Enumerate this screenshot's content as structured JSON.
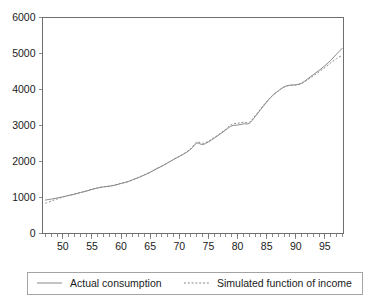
{
  "chart_data": {
    "type": "line",
    "title": "",
    "subtitle": "",
    "xlabel": "",
    "ylabel": "",
    "xlim": [
      1946.5,
      1998.2
    ],
    "ylim": [
      0,
      6000
    ],
    "grid": false,
    "legend_position": "bottom",
    "x_tick_labels": [
      "50",
      "55",
      "60",
      "65",
      "70",
      "75",
      "80",
      "85",
      "90",
      "95"
    ],
    "x_tick_values": [
      1950,
      1955,
      1960,
      1965,
      1970,
      1975,
      1980,
      1985,
      1990,
      1995
    ],
    "x_minor_tick_step": 1,
    "y_tick_labels": [
      "0",
      "1000",
      "2000",
      "3000",
      "4000",
      "5000",
      "6000"
    ],
    "y_tick_values": [
      0,
      1000,
      2000,
      3000,
      4000,
      5000,
      6000
    ],
    "x": [
      1947,
      1948,
      1949,
      1950,
      1951,
      1952,
      1953,
      1954,
      1955,
      1956,
      1957,
      1958,
      1959,
      1960,
      1961,
      1962,
      1963,
      1964,
      1965,
      1966,
      1967,
      1968,
      1969,
      1970,
      1971,
      1972,
      1973,
      1974,
      1975,
      1976,
      1977,
      1978,
      1979,
      1980,
      1981,
      1982,
      1983,
      1984,
      1985,
      1986,
      1987,
      1988,
      1989,
      1990,
      1991,
      1992,
      1993,
      1994,
      1995,
      1996,
      1997,
      1998
    ],
    "series": [
      {
        "name": "Actual consumption",
        "style": "solid",
        "color": "#8a8a8a",
        "values": [
          930,
          955,
          985,
          1020,
          1055,
          1090,
          1135,
          1175,
          1225,
          1265,
          1295,
          1310,
          1345,
          1390,
          1430,
          1490,
          1555,
          1625,
          1700,
          1790,
          1870,
          1960,
          2055,
          2140,
          2230,
          2345,
          2510,
          2470,
          2545,
          2650,
          2760,
          2880,
          2990,
          3010,
          3045,
          3060,
          3240,
          3450,
          3650,
          3830,
          3960,
          4075,
          4120,
          4130,
          4175,
          4290,
          4410,
          4530,
          4660,
          4810,
          4980,
          5150
        ]
      },
      {
        "name": "Simulated function of income",
        "style": "dotted",
        "color": "#8a8a8a",
        "values": [
          840,
          900,
          960,
          1010,
          1060,
          1100,
          1140,
          1180,
          1230,
          1270,
          1300,
          1320,
          1350,
          1395,
          1435,
          1495,
          1560,
          1630,
          1705,
          1795,
          1875,
          1965,
          2060,
          2145,
          2240,
          2360,
          2540,
          2505,
          2560,
          2665,
          2775,
          2900,
          3030,
          3060,
          3090,
          3085,
          3265,
          3470,
          3665,
          3835,
          3960,
          4070,
          4115,
          4125,
          4165,
          4270,
          4380,
          4490,
          4610,
          4740,
          4860,
          4950
        ]
      }
    ]
  },
  "legend": {
    "items": [
      {
        "label": "Actual consumption",
        "style": "solid"
      },
      {
        "label": "Simulated function of income",
        "style": "dotted"
      }
    ]
  }
}
